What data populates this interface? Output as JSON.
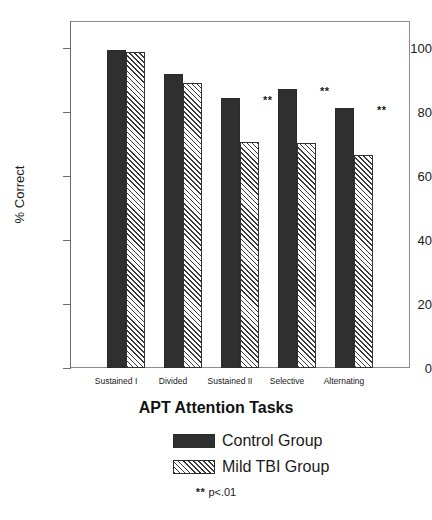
{
  "chart_data": {
    "type": "bar",
    "title": "",
    "xlabel": "APT Attention Tasks",
    "ylabel": "% Correct",
    "categories": [
      "Sustained I",
      "Divided",
      "Sustained II",
      "Selective",
      "Alternating"
    ],
    "series": [
      {
        "name": "Control Group",
        "values": [
          99.5,
          92.0,
          84.5,
          87.3,
          81.2
        ],
        "color": "#2f2f2f",
        "fill": "solid"
      },
      {
        "name": "Mild TBI Group",
        "values": [
          98.7,
          89.0,
          70.7,
          70.2,
          66.6
        ],
        "color": "#3a3a3a",
        "fill": "diagonal-hatch"
      }
    ],
    "ylim": [
      0,
      110
    ],
    "yticks": [
      0,
      20,
      40,
      60,
      80,
      100
    ],
    "ytick_labels": [
      "0",
      "20",
      "40",
      "60",
      "80",
      "100"
    ],
    "grid": false,
    "legend_position": "bottom",
    "annotations": [
      {
        "category": "Sustained II",
        "text": "**"
      },
      {
        "category": "Selective",
        "text": "**"
      },
      {
        "category": "Alternating",
        "text": "**"
      }
    ],
    "footnote": {
      "stars": "**",
      "text": "p<.01"
    }
  },
  "legend": {
    "items": [
      {
        "label": "Control Group",
        "swatch": "solid-dark-swatch"
      },
      {
        "label": "Mild TBI Group",
        "swatch": "hatched-swatch"
      }
    ]
  }
}
